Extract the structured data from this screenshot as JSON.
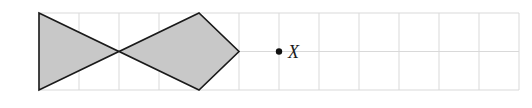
{
  "figure": {
    "grid": {
      "origin_x": 39,
      "origin_y": 13,
      "cell_w": 40,
      "cell_h": 38.5,
      "cols": 12,
      "rows": 2,
      "line_color": "#d9d9d9"
    },
    "shape": {
      "fill_color": "#c8c8c8",
      "stroke_color": "#1a1a1a",
      "vertices_grid": [
        [
          0,
          0
        ],
        [
          2,
          1
        ],
        [
          4,
          0
        ],
        [
          5,
          1
        ],
        [
          4,
          2
        ],
        [
          2,
          1
        ],
        [
          0,
          2
        ]
      ]
    },
    "point": {
      "label": "X",
      "grid_x": 6,
      "grid_y": 1,
      "color": "#111111"
    }
  }
}
